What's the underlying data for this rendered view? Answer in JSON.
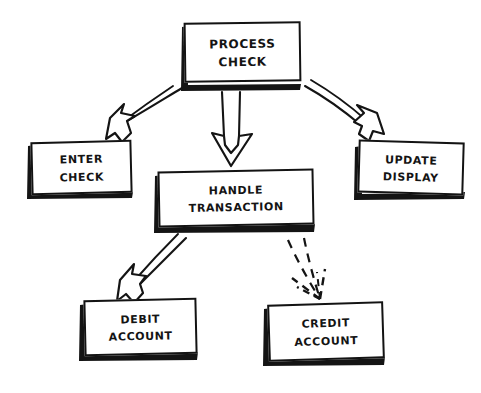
{
  "diagram": {
    "title": "Process Check",
    "style": "hand-drawn-sketch",
    "background_color": "#ffffff",
    "ink_color": "#131313",
    "nodes": [
      {
        "id": "process-check",
        "line1": "Process",
        "line2": "Check",
        "role": "root"
      },
      {
        "id": "enter-check",
        "line1": "Enter",
        "line2": "Check",
        "role": "leaf"
      },
      {
        "id": "handle-transaction",
        "line1": "Handle",
        "line2": "Transaction",
        "role": "branch"
      },
      {
        "id": "update-display",
        "line1": "Update",
        "line2": "Display",
        "role": "leaf"
      },
      {
        "id": "debit-account",
        "line1": "Debit",
        "line2": "Account",
        "role": "leaf"
      },
      {
        "id": "credit-account",
        "line1": "Credit",
        "line2": "Account",
        "role": "leaf"
      }
    ],
    "edges": [
      {
        "id": "edge-process-to-enter",
        "from": "process-check",
        "to": "enter-check",
        "stroke": "solid",
        "head": "hollow"
      },
      {
        "id": "edge-process-to-handle",
        "from": "process-check",
        "to": "handle-transaction",
        "stroke": "solid",
        "head": "hollow"
      },
      {
        "id": "edge-process-to-update",
        "from": "process-check",
        "to": "update-display",
        "stroke": "solid",
        "head": "hollow"
      },
      {
        "id": "edge-handle-to-debit",
        "from": "handle-transaction",
        "to": "debit-account",
        "stroke": "solid",
        "head": "hollow"
      },
      {
        "id": "edge-handle-to-credit",
        "from": "handle-transaction",
        "to": "credit-account",
        "stroke": "dashed",
        "head": "hollow"
      }
    ]
  }
}
